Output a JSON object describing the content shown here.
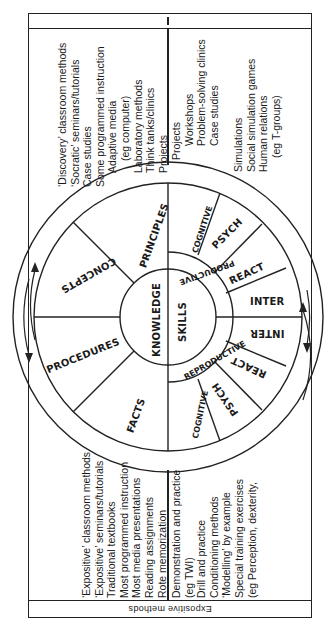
{
  "frame": {
    "top_band_label": "",
    "bottom_band_label": "Expositive methods"
  },
  "quadrants": {
    "knowledge_exploratory": {
      "items": [
        "‘Discovery’ classroom methods",
        "‘Socratic’ seminars/tutorials",
        "Case studies",
        "Some programmed instruction",
        "Adaptive media",
        "(eg computer)",
        "Laboratory methods",
        "Think tanks/clinics",
        "Projects"
      ]
    },
    "skills_exploratory": {
      "group1": [
        "Projects",
        "Workshops",
        "Problem-solving clinics",
        "Case studies"
      ],
      "group2": [
        "Simulations",
        "Social simulation games",
        "Human relations",
        "(eg T-groups)"
      ]
    },
    "knowledge_expositive": {
      "items": [
        "‘Expositive’ classroom methods",
        "‘Expositive’ seminars/tutorials",
        "Traditional textbooks",
        "Most programmed instruction",
        "Most media presentations",
        "Reading assignments",
        "Rote memorization"
      ]
    },
    "skills_expositive": {
      "items": [
        "Demonstration and practice",
        "(eg TWI)",
        "Drill and practice",
        "Conditioning methods",
        "‘Modelling’ by example",
        "Special training exercises",
        "(eg Perception, dexterity,"
      ]
    }
  },
  "wheel": {
    "hub": {
      "left": "KNOWLEDGE",
      "right": "SKILLS"
    },
    "skills_band": {
      "top": "PRODUCTIVE",
      "bottom": "REPRODUCTIVE"
    },
    "knowledge_sectors": [
      "PRINCIPLES",
      "CONCEPTS",
      "PROCEDURES",
      "FACTS"
    ],
    "skills_productive_sectors": [
      "COGNITIVE",
      "PSYCH",
      "REACT",
      "INTER"
    ],
    "skills_reproductive_sectors": [
      "INTER",
      "REACT",
      "PSYCH",
      "COGNITIVE"
    ],
    "arrows": [
      "circular-arrow-left",
      "circular-arrow-right"
    ]
  },
  "colors": {
    "line": "#222222",
    "background": "#ffffff",
    "text": "#1a1a1a"
  }
}
